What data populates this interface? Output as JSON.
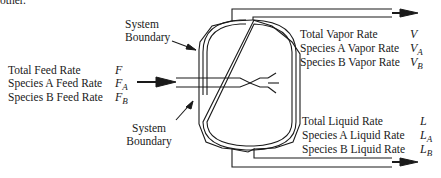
{
  "clipped_text": "other.",
  "diagram": {
    "boundary_labels": [
      {
        "line1": "System",
        "line2": "Boundary"
      },
      {
        "line1": "System",
        "line2": "Boundary"
      }
    ],
    "feed": {
      "rows": [
        {
          "label": "Total Feed Rate",
          "symbol": "F",
          "sub": ""
        },
        {
          "label": "Species A Feed Rate",
          "symbol": "F",
          "sub": "A"
        },
        {
          "label": "Species B Feed Rate",
          "symbol": "F",
          "sub": "B"
        }
      ]
    },
    "vapor": {
      "rows": [
        {
          "label": "Total Vapor Rate",
          "symbol": "V",
          "sub": ""
        },
        {
          "label": "Species A Vapor Rate",
          "symbol": "V",
          "sub": "A"
        },
        {
          "label": "Species B Vapor Rate",
          "symbol": "V",
          "sub": "B"
        }
      ]
    },
    "liquid": {
      "rows": [
        {
          "label": "Total  Liquid Rate",
          "symbol": "L",
          "sub": ""
        },
        {
          "label": "Species A Liquid Rate",
          "symbol": "L",
          "sub": "A"
        },
        {
          "label": "Species B Liquid Rate",
          "symbol": "L",
          "sub": "B"
        }
      ]
    }
  }
}
